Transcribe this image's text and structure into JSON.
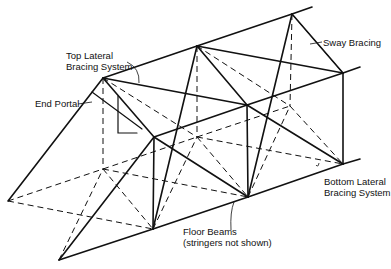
{
  "diagram": {
    "labels": {
      "top_lateral_1": "Top Lateral",
      "top_lateral_2": "Bracing System",
      "end_portal": "End Portal",
      "sway_bracing": "Sway Bracing",
      "bottom_lateral_1": "Bottom Lateral",
      "bottom_lateral_2": "Bracing System",
      "floor_beams_1": "Floor Beams",
      "floor_beams_2": "(stringers not shown)"
    }
  }
}
